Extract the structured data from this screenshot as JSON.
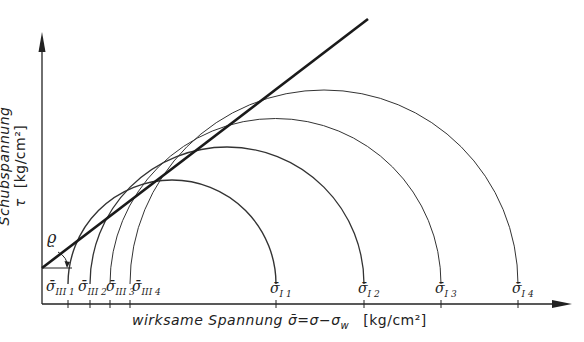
{
  "diagram": {
    "type": "Mohr circles with failure envelope",
    "y_axis": {
      "label": "Schubspannung τ",
      "unit": "[kg/cm²]"
    },
    "x_axis": {
      "label": "wirksame Spannung σ̄ = σ − σ_w",
      "label_text": "wirksame Spannung σ̄=σ−σ",
      "label_sub": "w",
      "unit": "[kg/cm²]"
    },
    "angle_label": "ϱ",
    "envelope": {
      "style": "thick straight line",
      "color": "#1a1a1a"
    },
    "circles": [
      {
        "name": "circle-1",
        "sigma_min_label": "σ̄",
        "sigma_min_sub": "III 1",
        "sigma_max_label": "σ̄",
        "sigma_max_sub": "I 1"
      },
      {
        "name": "circle-2",
        "sigma_min_label": "σ̄",
        "sigma_min_sub": "III 2",
        "sigma_max_label": "σ̄",
        "sigma_max_sub": "I 2"
      },
      {
        "name": "circle-3",
        "sigma_min_label": "σ̄",
        "sigma_min_sub": "III 3",
        "sigma_max_label": "σ̄",
        "sigma_max_sub": "I 3"
      },
      {
        "name": "circle-4",
        "sigma_min_label": "σ̄",
        "sigma_min_sub": "III 4",
        "sigma_max_label": "σ̄",
        "sigma_max_sub": "I 4"
      }
    ],
    "colors": {
      "ink": "#222222",
      "background": "#ffffff"
    }
  }
}
